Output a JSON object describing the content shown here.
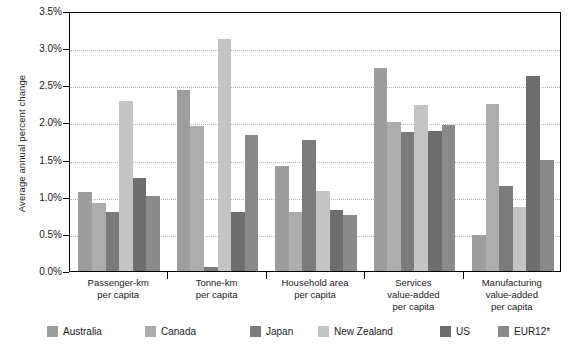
{
  "chart_data": {
    "type": "bar",
    "title": "",
    "subtitle": "",
    "xlabel": "",
    "ylabel": "Average annual percent change",
    "ylim": [
      0.0,
      3.5
    ],
    "ytick_labels": [
      "0.0%",
      "0.5%",
      "1.0%",
      "1.5%",
      "2.0%",
      "2.5%",
      "3.0%",
      "3.5%"
    ],
    "ytick_values": [
      0.0,
      0.5,
      1.0,
      1.5,
      2.0,
      2.5,
      3.0,
      3.5
    ],
    "grid": true,
    "legend_position": "bottom",
    "categories": [
      "Passenger-km\nper capita",
      "Tonne-km\nper capita",
      "Household area\nper capita",
      "Services\nvalue-added\nper capita",
      "Manufacturing\nvalue-added\nper capita"
    ],
    "category_lines": [
      [
        "Passenger-km",
        "per capita"
      ],
      [
        "Tonne-km",
        "per capita"
      ],
      [
        "Household area",
        "per capita"
      ],
      [
        "Services",
        "value-added",
        "per capita"
      ],
      [
        "Manufacturing",
        "value-added",
        "per capita"
      ]
    ],
    "series": [
      {
        "name": "Australia",
        "color": "#9d9d9d",
        "values": [
          1.07,
          2.44,
          1.41,
          2.73,
          0.49
        ]
      },
      {
        "name": "Canada",
        "color": "#adadad",
        "values": [
          0.91,
          1.95,
          0.8,
          2.0,
          2.25
        ]
      },
      {
        "name": "Japan",
        "color": "#7b7b7b",
        "values": [
          0.79,
          0.05,
          1.77,
          1.87,
          1.15
        ]
      },
      {
        "name": "New Zealand",
        "color": "#c4c4c4",
        "values": [
          2.29,
          3.12,
          1.08,
          2.23,
          0.86
        ]
      },
      {
        "name": "US",
        "color": "#6e6e6e",
        "values": [
          1.25,
          0.79,
          0.82,
          1.88,
          2.62
        ]
      },
      {
        "name": "EUR12*",
        "color": "#8a8a8a",
        "values": [
          1.01,
          1.83,
          0.76,
          1.97,
          1.5
        ]
      }
    ]
  },
  "legend": {
    "items": [
      {
        "label": "Australia"
      },
      {
        "label": "Canada"
      },
      {
        "label": "Japan"
      },
      {
        "label": "New Zealand"
      },
      {
        "label": "US"
      },
      {
        "label": "EUR12*"
      }
    ]
  }
}
